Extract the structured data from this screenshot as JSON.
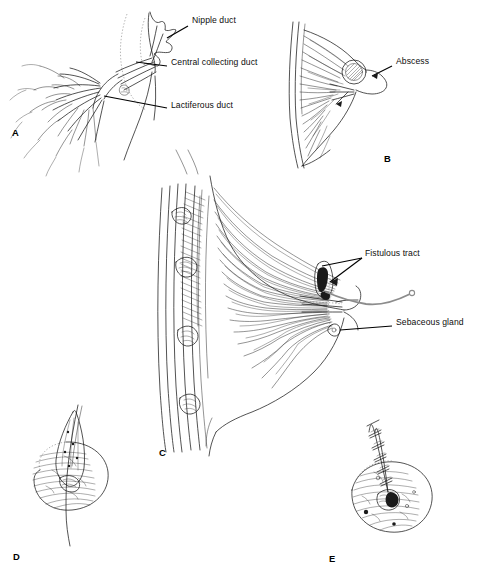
{
  "figure": {
    "kind": "medical-illustration",
    "background": "#ffffff",
    "ink": "#1a1a1a",
    "accent_gray": "#8c8c8c",
    "width": 495,
    "height": 581
  },
  "panels": [
    {
      "id": "A",
      "letter": "A",
      "letter_pos": {
        "x": 12,
        "y": 127
      },
      "description": "Ductal tree of the nipple shown in sagittal section with branching lactiferous ducts"
    },
    {
      "id": "B",
      "letter": "B",
      "letter_pos": {
        "x": 384,
        "y": 153
      },
      "description": "Breast profile with subareolar abscess at the nipple"
    },
    {
      "id": "C",
      "letter": "C",
      "letter_pos": {
        "x": 159,
        "y": 447
      },
      "description": "Sagittal breast with chest wall and ribs, probe in fistulous tract"
    },
    {
      "id": "D",
      "letter": "D",
      "letter_pos": {
        "x": 13,
        "y": 551
      },
      "description": "Excised fistulous tract specimen elevated on a probe through the areola"
    },
    {
      "id": "E",
      "letter": "E",
      "letter_pos": {
        "x": 329,
        "y": 553
      },
      "description": "Areola after excision closed with interrupted sutures"
    }
  ],
  "labels": [
    {
      "id": "nipple-duct",
      "text": "Nipple duct",
      "panel": "A",
      "pos": {
        "x": 192,
        "y": 20
      },
      "multiline": false
    },
    {
      "id": "central-collecting-duct",
      "text": "Central collecting duct",
      "panel": "A",
      "pos": {
        "x": 171,
        "y": 62
      },
      "multiline": true
    },
    {
      "id": "lactiferous-duct",
      "text": "Lactiferous duct",
      "panel": "A",
      "pos": {
        "x": 171,
        "y": 104
      },
      "multiline": false
    },
    {
      "id": "abscess",
      "text": "Abscess",
      "panel": "B",
      "pos": {
        "x": 396,
        "y": 61
      },
      "multiline": false
    },
    {
      "id": "fistulous-tract",
      "text": "Fistulous tract",
      "panel": "C",
      "pos": {
        "x": 365,
        "y": 253
      },
      "multiline": false
    },
    {
      "id": "sebaceous-gland",
      "text": "Sebaceous gland",
      "panel": "C",
      "pos": {
        "x": 396,
        "y": 322
      },
      "multiline": false
    }
  ],
  "caption": {
    "text": "",
    "visible": false
  }
}
